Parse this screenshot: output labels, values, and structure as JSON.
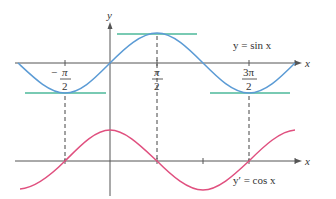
{
  "figure": {
    "colors": {
      "axis": "#555555",
      "sin_curve": "#5b9bd5",
      "cos_curve": "#e0507f",
      "tangent_lines": "#4db89a",
      "dashed_guides": "#444444",
      "text": "#333333"
    },
    "top_graph": {
      "x_axis_label": "x",
      "y_axis_label": "y",
      "curve_label": "y = sin x",
      "tick_labels": [
        {
          "num": "−π",
          "den": "2",
          "sign": "−",
          "value": "-π/2"
        },
        {
          "num": "π",
          "den": "2",
          "sign": "",
          "value": "π/2"
        },
        {
          "num": "3π",
          "den": "2",
          "sign": "",
          "value": "3π/2"
        }
      ],
      "tangent_lines_at": [
        "-π/2",
        "π/2",
        "3π/2"
      ]
    },
    "bottom_graph": {
      "x_axis_label": "x",
      "curve_label": "y′ = cos x",
      "zeros_marked_at": [
        "-π/2",
        "π/2",
        "3π/2"
      ]
    },
    "x_domain": [
      "-π",
      "2π"
    ]
  }
}
